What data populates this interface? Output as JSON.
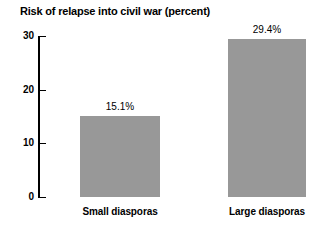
{
  "chart_data": {
    "type": "bar",
    "title": "Risk of relapse into civil war (percent)",
    "subtitle": "",
    "xlabel": "",
    "ylabel": "",
    "categories": [
      "Small diasporas",
      "Large diasporas"
    ],
    "values": [
      15.1,
      29.4
    ],
    "value_labels": [
      "15.1%",
      "29.4%"
    ],
    "ylim": [
      0,
      30
    ],
    "y_ticks": [
      0,
      10,
      20,
      30
    ],
    "y_tick_labels": [
      "0",
      "10",
      "20",
      "30"
    ],
    "grid": false,
    "legend": null,
    "bar_color": "#989898",
    "axis_color": "#000000",
    "text_color": "#000000",
    "background_color": "#ffffff"
  }
}
